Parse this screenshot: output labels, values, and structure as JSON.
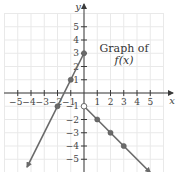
{
  "chart_data": {
    "type": "line",
    "title": "",
    "annotation": [
      "Graph of",
      "f(x)"
    ],
    "xlabel": "x",
    "ylabel": "y",
    "xlim": [
      -6,
      6
    ],
    "ylim": [
      -6,
      6
    ],
    "grid": true,
    "x_ticks": [
      -5,
      -4,
      -3,
      -2,
      -1,
      1,
      2,
      3,
      4,
      5
    ],
    "y_ticks": [
      5,
      4,
      3,
      2,
      1,
      -1,
      -2,
      -3,
      -4,
      -5
    ],
    "x_tick_labels": [
      "−5",
      "−4",
      "−3",
      "−2",
      "−1",
      "1",
      "2",
      "3",
      "4",
      "5"
    ],
    "y_tick_labels": [
      "5",
      "4",
      "3",
      "2",
      "1",
      "−1",
      "−2",
      "−3",
      "−4",
      "−5"
    ],
    "series": [
      {
        "name": "left piece: y = 2x + 3 (x ≤ 0)",
        "points": [
          [
            0,
            3
          ],
          [
            -1,
            1
          ],
          [
            -2,
            -1
          ]
        ],
        "line_from": [
          0,
          3
        ],
        "line_to": [
          -4.3,
          -5.6
        ],
        "endpoint_closed": true,
        "arrow_at_end": true
      },
      {
        "name": "right piece: y = -x - 1 (x > 0)",
        "points": [
          [
            1,
            -2
          ],
          [
            2,
            -3
          ],
          [
            3,
            -4
          ]
        ],
        "open_point": [
          0,
          -1
        ],
        "line_from": [
          0,
          -1
        ],
        "line_to": [
          5,
          -6
        ],
        "arrow_at_end": true
      }
    ]
  }
}
